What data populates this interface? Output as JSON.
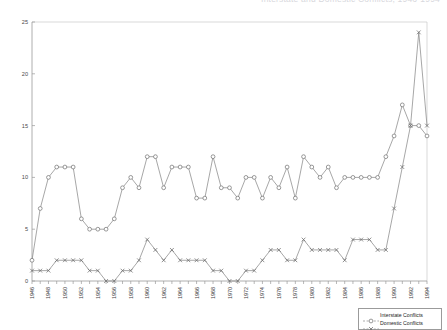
{
  "chart_data": {
    "type": "line",
    "title": "Interstate and Domestic Conflicts, 1946-1994",
    "xlabel": "",
    "ylabel": "",
    "ylim": [
      0,
      25
    ],
    "yticks": [
      0,
      5,
      10,
      15,
      20,
      25
    ],
    "grid": false,
    "legend_position": "bottom-right",
    "x": [
      1946,
      1947,
      1948,
      1949,
      1950,
      1951,
      1952,
      1953,
      1954,
      1955,
      1956,
      1957,
      1958,
      1959,
      1960,
      1961,
      1962,
      1963,
      1964,
      1965,
      1966,
      1967,
      1968,
      1969,
      1970,
      1971,
      1972,
      1973,
      1974,
      1975,
      1976,
      1977,
      1978,
      1979,
      1980,
      1981,
      1982,
      1983,
      1984,
      1985,
      1986,
      1987,
      1988,
      1989,
      1990,
      1991,
      1992,
      1993,
      1994
    ],
    "xtick_labels": [
      "1946",
      "1948",
      "1950",
      "1952",
      "1954",
      "1956",
      "1958",
      "1960",
      "1962",
      "1964",
      "1966",
      "1968",
      "1970",
      "1972",
      "1974",
      "1976",
      "1978",
      "1980",
      "1982",
      "1984",
      "1986",
      "1988",
      "1990",
      "1992",
      "1994"
    ],
    "series": [
      {
        "name": "Interstate Conflicts",
        "marker": "circle",
        "values": [
          2,
          7,
          10,
          11,
          11,
          11,
          6,
          5,
          5,
          5,
          6,
          9,
          10,
          9,
          12,
          12,
          9,
          11,
          11,
          11,
          8,
          8,
          12,
          9,
          9,
          8,
          10,
          10,
          8,
          10,
          9,
          11,
          8,
          12,
          11,
          10,
          11,
          9,
          10,
          10,
          10,
          10,
          10,
          12,
          14,
          17,
          15,
          15,
          14
        ]
      },
      {
        "name": "Domestic Conflicts",
        "marker": "x",
        "values": [
          1,
          1,
          1,
          2,
          2,
          2,
          2,
          1,
          1,
          0,
          0,
          1,
          1,
          2,
          4,
          3,
          2,
          3,
          2,
          2,
          2,
          2,
          1,
          1,
          0,
          0,
          1,
          1,
          2,
          3,
          3,
          2,
          2,
          4,
          3,
          3,
          3,
          3,
          2,
          4,
          4,
          4,
          3,
          3,
          7,
          11,
          15,
          24,
          15
        ]
      }
    ]
  },
  "legend": {
    "items": [
      {
        "label": "Interstate Conflicts",
        "marker": "circle"
      },
      {
        "label": "Domestic Conflicts",
        "marker": "x"
      }
    ]
  }
}
